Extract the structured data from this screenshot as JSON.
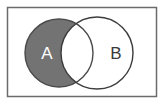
{
  "figure": {
    "name": "venn-diagram",
    "width": 164,
    "height": 105,
    "background_color": "#ffffff",
    "frame": {
      "name": "diagram-border",
      "x": 7.5,
      "y": 7.5,
      "width": 149,
      "height": 89,
      "stroke_color": "#6b6b6b",
      "stroke_width": 1.5,
      "fill_color": "#ffffff"
    }
  },
  "chart_data": {
    "type": "venn",
    "title": "",
    "sets": [
      {
        "id": "A",
        "label": "A",
        "cx": 59,
        "cy": 53,
        "r": 34,
        "fill": "#ffffff",
        "stroke": "#4a4a4a",
        "label_color": "#ffffff",
        "label_x": 47,
        "label_y": 53
      },
      {
        "id": "B",
        "label": "B",
        "cx": 97,
        "cy": 53,
        "r": 36,
        "fill": "#ffffff",
        "stroke": "#3c3c3c",
        "label_color": "#3a3a3a",
        "label_x": 116,
        "label_y": 53
      }
    ],
    "regions": [
      {
        "id": "A_only",
        "name": "a-minus-b-region",
        "description": "A not B",
        "shaded": true,
        "fill": "#737373"
      },
      {
        "id": "A_and_B",
        "name": "intersection-region",
        "description": "A intersect B",
        "shaded": false,
        "fill": "#ffffff"
      },
      {
        "id": "B_only",
        "name": "b-minus-a-region",
        "description": "B not A",
        "shaded": false,
        "fill": "#ffffff"
      }
    ],
    "shaded_expression": "A \\ B",
    "legend": null,
    "grid": false
  }
}
